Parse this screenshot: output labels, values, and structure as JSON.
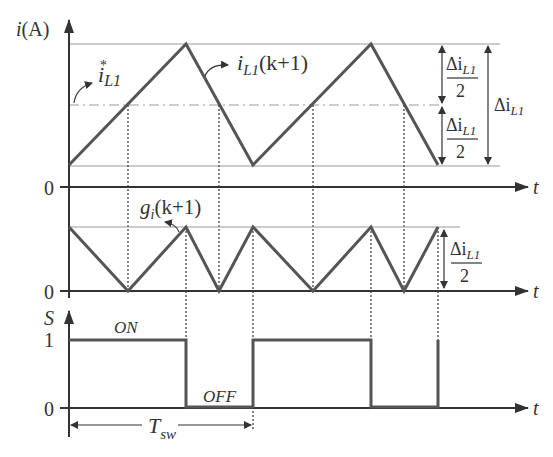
{
  "figure": {
    "type": "timing-diagram",
    "panels": [
      {
        "name": "inductor-current",
        "y_axis_label": "i(A)",
        "x_axis_label": "t",
        "zero_label": "0",
        "annotations": {
          "reference": "i*L1",
          "reference_main": "i",
          "reference_sup": "*",
          "reference_sub": "L1",
          "current": "iL1(k+1)",
          "current_main": "i",
          "current_sub": "L1",
          "current_tail": "(k+1)",
          "half_ripple_num": "Δi",
          "half_ripple_sub": "L1",
          "half_ripple_den": "2",
          "ripple_main": "Δi",
          "ripple_sub": "L1"
        },
        "waveform": {
          "shape": "triangle",
          "levels": [
            "low",
            "high"
          ],
          "peaks_at_period_fraction": [
            0,
            0.5,
            1,
            1.5,
            2
          ],
          "ripple": "Δi_L1",
          "reference_level": "midpoint"
        }
      },
      {
        "name": "cost-function",
        "annotation": "gi(k+1)",
        "annotation_main": "g",
        "annotation_sub": "i",
        "annotation_tail": "(k+1)",
        "x_axis_label": "t",
        "zero_label": "0",
        "amplitude_num": "Δi",
        "amplitude_sub": "L1",
        "amplitude_den": "2",
        "waveform": {
          "shape": "absolute-error",
          "max": "Δi_L1/2",
          "min": 0
        }
      },
      {
        "name": "switching-signal",
        "y_axis_label": "S",
        "x_axis_label": "t",
        "one_label": "1",
        "zero_label": "0",
        "on_label": "ON",
        "off_label": "OFF",
        "period_main": "T",
        "period_sub": "sw",
        "states": [
          1,
          0,
          1,
          0,
          1
        ]
      }
    ]
  }
}
